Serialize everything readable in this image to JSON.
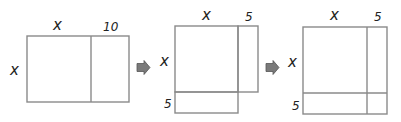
{
  "diagram": {
    "colors": {
      "stroke": "#8a8a8a",
      "arrow": "#7a7a7a",
      "text": "#222222"
    },
    "panels": [
      {
        "id": "panel-1",
        "labels": {
          "top_left": "x",
          "top_right": "10",
          "left": "x"
        }
      },
      {
        "id": "panel-2",
        "labels": {
          "top_left": "x",
          "top_right": "5",
          "left": "x",
          "bottom_left": "5"
        }
      },
      {
        "id": "panel-3",
        "labels": {
          "top_left": "x",
          "top_right": "5",
          "left": "x",
          "bottom_left": "5"
        }
      }
    ],
    "arrows": [
      {
        "id": "arrow-1",
        "icon": "right-arrow-icon"
      },
      {
        "id": "arrow-2",
        "icon": "right-arrow-icon"
      }
    ]
  }
}
